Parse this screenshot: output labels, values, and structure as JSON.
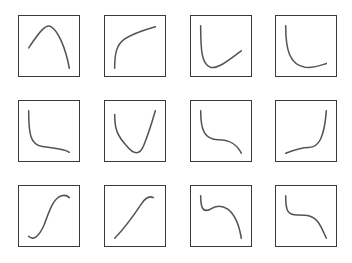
{
  "diagram": {
    "rows": 3,
    "columns": 4,
    "stroke_color": "#555555",
    "border_color": "#3a3a3a",
    "panels": [
      {
        "id": "p1",
        "row": 0,
        "col": 0,
        "x": 18,
        "y": 15,
        "shape": "inverted-parabola",
        "path": "M10 33 C 22 15, 28 8, 33 11 C 40 15, 48 32, 52 54"
      },
      {
        "id": "p2",
        "row": 0,
        "col": 1,
        "x": 104,
        "y": 15,
        "shape": "logarithmic-rise",
        "path": "M10 54 C 10 38, 12 30, 20 24 C 30 17, 42 14, 52 11"
      },
      {
        "id": "p3",
        "row": 0,
        "col": 2,
        "x": 190,
        "y": 15,
        "shape": "hook-up-right",
        "path": "M10 10 C 10 35, 11 50, 20 53 C 28 55, 40 45, 52 36"
      },
      {
        "id": "p4",
        "row": 0,
        "col": 3,
        "x": 275,
        "y": 15,
        "shape": "decay-slight-rise",
        "path": "M10 10 C 10 35, 14 50, 30 53 C 40 54, 46 51, 52 49"
      },
      {
        "id": "p5",
        "row": 1,
        "col": 0,
        "x": 18,
        "y": 100,
        "shape": "decay-flat",
        "path": "M10 10 C 10 35, 12 45, 24 47 C 36 49, 46 49, 52 53"
      },
      {
        "id": "p6",
        "row": 1,
        "col": 1,
        "x": 104,
        "y": 100,
        "shape": "asymmetric-valley",
        "path": "M10 14 C 10 28, 12 35, 22 46 C 30 56, 36 56, 40 46 C 44 36, 48 24, 52 10"
      },
      {
        "id": "p7",
        "row": 1,
        "col": 2,
        "x": 190,
        "y": 100,
        "shape": "decreasing-cubic",
        "path": "M10 10 C 10 30, 14 40, 28 40 C 42 40, 48 46, 52 54"
      },
      {
        "id": "p8",
        "row": 1,
        "col": 3,
        "x": 275,
        "y": 100,
        "shape": "increasing-cubic",
        "path": "M10 54 C 20 50, 26 48, 34 48 C 44 48, 50 38, 52 10"
      },
      {
        "id": "p9",
        "row": 2,
        "col": 0,
        "x": 18,
        "y": 185,
        "shape": "s-curve-wavy",
        "path": "M10 52 C 14 56, 20 54, 26 40 C 32 24, 36 12, 44 10 C 48 9, 50 10, 52 12"
      },
      {
        "id": "p10",
        "row": 2,
        "col": 1,
        "x": 104,
        "y": 185,
        "shape": "s-curve-rise",
        "path": "M10 54 C 20 44, 30 30, 38 18 C 42 12, 46 10, 50 12"
      },
      {
        "id": "p11",
        "row": 2,
        "col": 2,
        "x": 190,
        "y": 185,
        "shape": "local-min-max-fall",
        "path": "M10 10 C 10 22, 12 28, 20 24 C 26 20, 32 20, 38 24 C 46 30, 50 42, 52 54"
      },
      {
        "id": "p12",
        "row": 2,
        "col": 3,
        "x": 275,
        "y": 185,
        "shape": "plateau-fall",
        "path": "M10 10 C 10 26, 12 30, 22 30 C 32 30, 38 30, 44 38 C 48 44, 50 50, 52 54"
      }
    ]
  }
}
